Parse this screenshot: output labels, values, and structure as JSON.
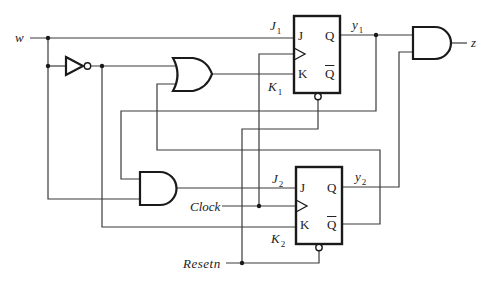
{
  "diagram": {
    "type": "sequential-circuit",
    "inputs": {
      "w": "w",
      "clock": "Clock",
      "reset": "Resetn"
    },
    "output": "z",
    "flipflops": [
      {
        "name": "FF1",
        "type": "JK",
        "pins": {
          "j": "J",
          "k": "K",
          "q": "Q",
          "qbar": "Q"
        },
        "j_label": {
          "base": "J",
          "sub": "1"
        },
        "k_label": {
          "base": "K",
          "sub": "1"
        },
        "q_label": {
          "base": "y",
          "sub": "1"
        }
      },
      {
        "name": "FF2",
        "type": "JK",
        "pins": {
          "j": "J",
          "k": "K",
          "q": "Q",
          "qbar": "Q"
        },
        "j_label": {
          "base": "J",
          "sub": "2"
        },
        "k_label": {
          "base": "K",
          "sub": "2"
        },
        "q_label": {
          "base": "y",
          "sub": "2"
        }
      }
    ],
    "gates": [
      {
        "name": "inverter",
        "type": "NOT"
      },
      {
        "name": "or-gate",
        "type": "OR"
      },
      {
        "name": "and-gate-j2",
        "type": "AND"
      },
      {
        "name": "and-gate-z",
        "type": "AND"
      }
    ],
    "colors": {
      "wire": "#3a3a3a",
      "gate": "#1a1a1a",
      "background": "#ffffff"
    }
  }
}
